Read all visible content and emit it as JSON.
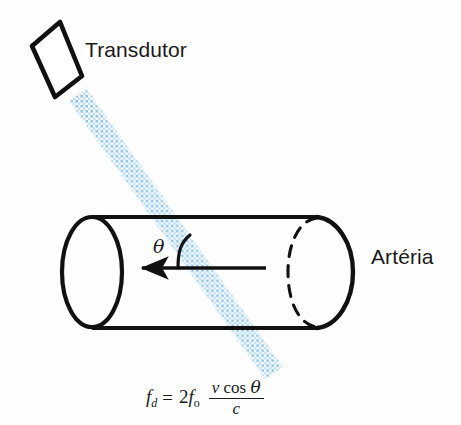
{
  "figure": {
    "background_color": "#fefefe",
    "width": 461,
    "height": 425
  },
  "labels": {
    "transducer": "Transdutor",
    "artery": "Artéria",
    "angle": "θ"
  },
  "formula": {
    "lhs_symbol": "f",
    "lhs_subscript": "d",
    "equals": "=",
    "coefficient": "2",
    "source_symbol": "f",
    "source_subscript": "o",
    "numerator_velocity": "v",
    "numerator_cos": "cos",
    "numerator_theta": "θ",
    "denominator": "c",
    "plain_text": "f_d = 2f_o (v cos θ)/c"
  },
  "colors": {
    "ink": "#1a1a1a",
    "beam": "#8cc4e8",
    "beam_light": "#cfe5f5",
    "background": "#fefefe"
  },
  "geometry": {
    "transducer_corners": "32,46 60,22 82,76 55,97",
    "beam_start": "78,95",
    "beam_end": "272,372",
    "cylinder_top_y": 217,
    "cylinder_bottom_y": 328,
    "cylinder_left_x": 92,
    "cylinder_right_x": 318,
    "flow_arrow_from": "265,268",
    "flow_arrow_to": "137,268"
  }
}
